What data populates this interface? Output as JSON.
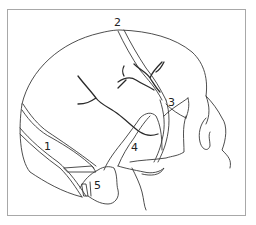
{
  "figure": {
    "type": "anatomical line drawing",
    "frame_color": "#a8a8a8",
    "line_color": "#3a3a3a",
    "background_color": "#ffffff"
  },
  "labels": [
    {
      "id": "1",
      "text": "1",
      "x": 44,
      "y": 141
    },
    {
      "id": "2",
      "text": "2",
      "x": 114,
      "y": 17
    },
    {
      "id": "3",
      "text": "3",
      "x": 168,
      "y": 97
    },
    {
      "id": "4",
      "text": "4",
      "x": 131,
      "y": 142
    },
    {
      "id": "5",
      "text": "5",
      "x": 94,
      "y": 180
    }
  ]
}
